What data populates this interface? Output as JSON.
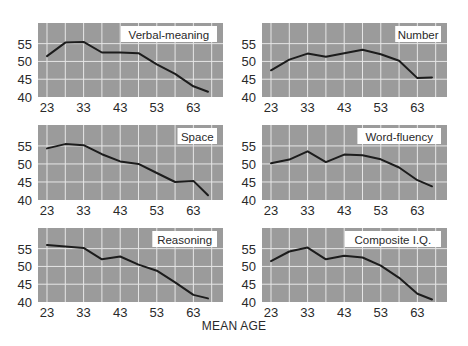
{
  "figure": {
    "xlabel": "MEAN AGE",
    "colors": {
      "panel_bg": "#9b9b9b",
      "grid": "#e6e6e6",
      "line": "#1c1c1c",
      "label_box": "#ffffff",
      "text": "#2a2a2a"
    }
  },
  "chart_data": [
    {
      "type": "line",
      "title": "Verbal-meaning",
      "xlabel": "MEAN AGE",
      "ylabel": "",
      "x": [
        23,
        28,
        33,
        38,
        43,
        48,
        53,
        58,
        63,
        67
      ],
      "values": [
        51.5,
        55.3,
        55.5,
        52.5,
        52.5,
        52.3,
        49.2,
        46.5,
        43.0,
        41.5
      ],
      "xticks": [
        23,
        33,
        43,
        53,
        63
      ],
      "yticks": [
        40,
        45,
        50,
        55
      ],
      "ylim": [
        40,
        60
      ],
      "grid": true
    },
    {
      "type": "line",
      "title": "Number",
      "xlabel": "MEAN AGE",
      "ylabel": "",
      "x": [
        23,
        28,
        33,
        38,
        43,
        48,
        53,
        58,
        63,
        67
      ],
      "values": [
        47.5,
        50.5,
        52.2,
        51.3,
        52.3,
        53.3,
        52.0,
        50.2,
        45.3,
        45.5
      ],
      "xticks": [
        23,
        33,
        43,
        53,
        63
      ],
      "yticks": [
        40,
        45,
        50,
        55
      ],
      "ylim": [
        40,
        60
      ],
      "grid": true
    },
    {
      "type": "line",
      "title": "Space",
      "xlabel": "MEAN AGE",
      "ylabel": "",
      "x": [
        23,
        28,
        33,
        38,
        43,
        48,
        53,
        58,
        63,
        67
      ],
      "values": [
        54.3,
        55.5,
        55.2,
        52.7,
        50.7,
        50.0,
        47.5,
        45.0,
        45.3,
        41.3
      ],
      "xticks": [
        23,
        33,
        43,
        53,
        63
      ],
      "yticks": [
        40,
        45,
        50,
        55
      ],
      "ylim": [
        40,
        60
      ],
      "grid": true
    },
    {
      "type": "line",
      "title": "Word-fluency",
      "xlabel": "MEAN AGE",
      "ylabel": "",
      "x": [
        23,
        28,
        33,
        38,
        43,
        48,
        53,
        58,
        63,
        67
      ],
      "values": [
        50.2,
        51.2,
        53.5,
        50.5,
        52.6,
        52.4,
        51.3,
        49.0,
        45.5,
        43.8
      ],
      "xticks": [
        23,
        33,
        43,
        53,
        63
      ],
      "yticks": [
        40,
        45,
        50,
        55
      ],
      "ylim": [
        40,
        60
      ],
      "grid": true
    },
    {
      "type": "line",
      "title": "Reasoning",
      "xlabel": "MEAN AGE",
      "ylabel": "",
      "x": [
        23,
        28,
        33,
        38,
        43,
        48,
        53,
        58,
        63,
        67
      ],
      "values": [
        56.0,
        55.6,
        55.2,
        52.0,
        52.8,
        50.5,
        48.8,
        45.5,
        42.0,
        41.0
      ],
      "xticks": [
        23,
        33,
        43,
        53,
        63
      ],
      "yticks": [
        40,
        45,
        50,
        55
      ],
      "ylim": [
        40,
        60
      ],
      "grid": true
    },
    {
      "type": "line",
      "title": "Composite I.Q.",
      "xlabel": "MEAN AGE",
      "ylabel": "",
      "x": [
        23,
        28,
        33,
        38,
        43,
        48,
        53,
        58,
        63,
        67
      ],
      "values": [
        51.5,
        54.2,
        55.3,
        52.0,
        53.0,
        52.5,
        50.2,
        46.8,
        42.3,
        40.7
      ],
      "xticks": [
        23,
        33,
        43,
        53,
        63
      ],
      "yticks": [
        40,
        45,
        50,
        55
      ],
      "ylim": [
        40,
        60
      ],
      "grid": true
    }
  ]
}
